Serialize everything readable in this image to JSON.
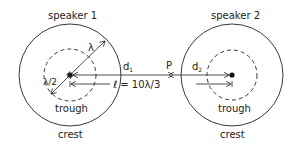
{
  "diagram": {
    "speaker1": {
      "label": "speaker 1",
      "trough_label": "trough",
      "crest_label": "crest"
    },
    "speaker2": {
      "label": "speaker 2",
      "trough_label": "trough",
      "crest_label": "crest"
    },
    "labels": {
      "lambda": "λ",
      "half_lambda": "λ/2",
      "d1": "d",
      "d1_sub": "1",
      "d2": "d",
      "d2_sub": "2",
      "point": "P",
      "separation": "ℓ = 10λ/3"
    },
    "colors": {
      "stroke": "#222222",
      "background": "#ffffff"
    }
  }
}
